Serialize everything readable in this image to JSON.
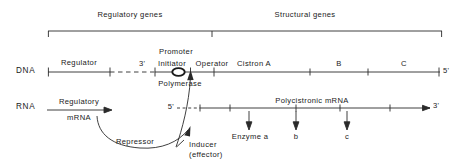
{
  "figure": {
    "type": "operon-regulation-diagram",
    "line_color": "#2a2a2a",
    "text_color": "#1a1a1a"
  },
  "brackets": {
    "regulatory_genes": "Regulatory  genes",
    "structural_genes": "Structural  genes"
  },
  "rows": {
    "dna_label": "DNA",
    "rna_label": "RNA"
  },
  "dna": {
    "regulator": "Regulator",
    "three_prime": "3'",
    "initiator": "Initiator",
    "promoter": "Promoter",
    "operator": "Operator",
    "polymerase": "Polymerase",
    "cistron_a": "Cistron  A",
    "cistron_b": "B",
    "cistron_c": "C",
    "five_prime": "5'"
  },
  "rna": {
    "five_prime": "5'",
    "three_prime": "3'",
    "regulatory_mrna_line1": "Regulatory",
    "regulatory_mrna_line2": "mRNA",
    "polycistronic_mrna": "Polycistronic   mRNA",
    "enzyme_a": "Enzyme  a",
    "enzyme_b": "b",
    "enzyme_c": "c"
  },
  "annotations": {
    "repressor": "Repressor",
    "inducer_line1": "Inducer",
    "inducer_line2": "(effector)"
  }
}
